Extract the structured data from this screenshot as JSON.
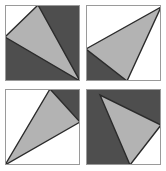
{
  "figure": {
    "width": 166,
    "height": 171,
    "background_color": "#ffffff",
    "colors": {
      "dark_gray": "#4e4e4e",
      "light_gray": "#b3b3b3",
      "white": "#ffffff",
      "outline": "#2b2b2b",
      "frame": "#9a9a9a"
    },
    "panels": [
      {
        "id": "top-left",
        "name": "panel-top-left",
        "background_color": "#4e4e4e",
        "frame_color": "#9a9a9a",
        "triangle_fill": "#b3b3b3",
        "triangle_outline": "#2b2b2b",
        "triangle_points": "33,0 0,32 75,76",
        "corner_patch": {
          "present": true,
          "color": "#ffffff",
          "points": "0,0 33,0 0,32"
        },
        "description": "Dark square; light gray triangle from top edge to left edge to bottom-right corner; white corner wedge at top-left"
      },
      {
        "id": "top-right",
        "name": "panel-top-right",
        "background_color": "#ffffff",
        "frame_color": "#9a9a9a",
        "triangle_fill": "#b3b3b3",
        "triangle_outline": "#2b2b2b",
        "triangle_points": "75,2 0,44 41,76",
        "corner_patch": {
          "present": true,
          "color": "#4e4e4e",
          "points": "0,44 0,76 41,76"
        },
        "description": "White square; light gray triangle from top-right corner to left edge to bottom edge; dark wedge at bottom-left"
      },
      {
        "id": "bottom-left",
        "name": "panel-bottom-left",
        "background_color": "#ffffff",
        "frame_color": "#9a9a9a",
        "triangle_fill": "#b3b3b3",
        "triangle_outline": "#2b2b2b",
        "triangle_points": "45,0 0,76 75,33",
        "corner_patch": {
          "present": true,
          "color": "#4e4e4e",
          "points": "45,0 75,0 75,33"
        },
        "description": "White square; light gray triangle from top edge to bottom-left corner to right edge; dark wedge at top-right"
      },
      {
        "id": "bottom-right",
        "name": "panel-bottom-right",
        "background_color": "#4e4e4e",
        "frame_color": "#9a9a9a",
        "triangle_fill": "#b3b3b3",
        "triangle_outline": "#2b2b2b",
        "triangle_points": "14,6 44,76 75,36",
        "corner_patch": {
          "present": true,
          "color": "#ffffff",
          "points": "44,76 75,76 75,36"
        },
        "description": "Dark square; light gray triangle from upper-left to bottom edge to right edge; white wedge at bottom-right"
      }
    ]
  }
}
